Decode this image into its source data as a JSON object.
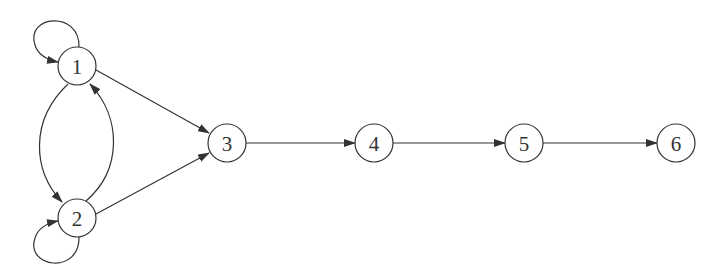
{
  "diagram": {
    "type": "directed-graph",
    "nodes": [
      {
        "id": "1",
        "label": "1",
        "x": 77,
        "y": 66
      },
      {
        "id": "2",
        "label": "2",
        "x": 77,
        "y": 218
      },
      {
        "id": "3",
        "label": "3",
        "x": 227,
        "y": 143
      },
      {
        "id": "4",
        "label": "4",
        "x": 374,
        "y": 143
      },
      {
        "id": "5",
        "label": "5",
        "x": 524,
        "y": 143
      },
      {
        "id": "6",
        "label": "6",
        "x": 676,
        "y": 143
      }
    ],
    "edges": [
      {
        "from": "1",
        "to": "1",
        "kind": "self-loop"
      },
      {
        "from": "2",
        "to": "2",
        "kind": "self-loop"
      },
      {
        "from": "1",
        "to": "2",
        "kind": "curved"
      },
      {
        "from": "2",
        "to": "1",
        "kind": "curved"
      },
      {
        "from": "1",
        "to": "3",
        "kind": "straight"
      },
      {
        "from": "2",
        "to": "3",
        "kind": "straight"
      },
      {
        "from": "3",
        "to": "4",
        "kind": "straight"
      },
      {
        "from": "4",
        "to": "5",
        "kind": "straight"
      },
      {
        "from": "5",
        "to": "6",
        "kind": "straight"
      }
    ],
    "colors": {
      "stroke": "#333333",
      "background": "#ffffff"
    }
  }
}
